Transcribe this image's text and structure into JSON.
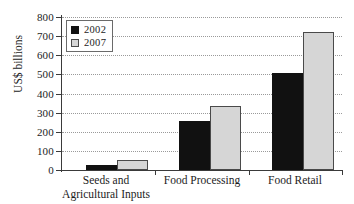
{
  "chart_data": {
    "type": "bar",
    "title": "",
    "xlabel": "",
    "ylabel": "US$ billions",
    "ylim": [
      0,
      800
    ],
    "yticks": [
      0,
      100,
      200,
      300,
      400,
      500,
      600,
      700,
      800
    ],
    "ytick_labels": [
      "0",
      "100",
      "200",
      "300",
      "400",
      "500",
      "600",
      "700",
      "800"
    ],
    "grid": true,
    "legend_position": "top-left",
    "categories": [
      "Seeds and Agricultural Inputs",
      "Food Processing",
      "Food Retail"
    ],
    "category_lines": [
      [
        "Seeds and",
        "Agricultural Inputs"
      ],
      [
        "Food Processing",
        ""
      ],
      [
        "Food Retail",
        ""
      ]
    ],
    "series": [
      {
        "name": "2002",
        "color": "#111111",
        "values": [
          25,
          255,
          505
        ]
      },
      {
        "name": "2007",
        "color": "#d6d6d6",
        "values": [
          50,
          335,
          720
        ]
      }
    ]
  },
  "legend": {
    "items": [
      {
        "label": "2002"
      },
      {
        "label": "2007"
      }
    ]
  },
  "axis": {
    "y_title": "US$ billions"
  }
}
